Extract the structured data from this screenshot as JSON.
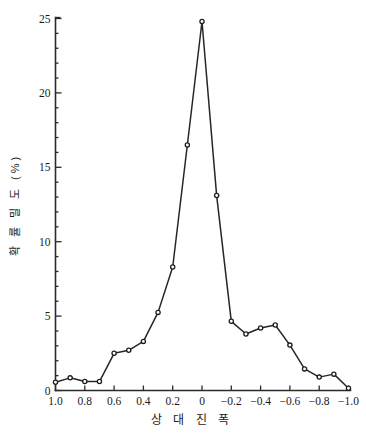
{
  "chart_data": {
    "type": "line",
    "title": "",
    "xlabel": "상 대 진 폭",
    "ylabel": "확 률 밀 도 (%)",
    "x": [
      1.0,
      0.9,
      0.8,
      0.7,
      0.6,
      0.5,
      0.4,
      0.3,
      0.2,
      0.1,
      0.0,
      -0.1,
      -0.2,
      -0.3,
      -0.4,
      -0.5,
      -0.6,
      -0.7,
      -0.8,
      -0.9,
      -1.0
    ],
    "values": [
      0.55,
      0.85,
      0.6,
      0.6,
      2.5,
      2.7,
      3.3,
      5.25,
      8.3,
      16.5,
      24.8,
      13.1,
      4.65,
      3.8,
      4.2,
      4.4,
      3.05,
      1.45,
      0.9,
      1.1,
      0.15
    ],
    "xlim": [
      1.0,
      -1.0
    ],
    "ylim": [
      0,
      25
    ],
    "xticks": [
      1.0,
      0.8,
      0.6,
      0.4,
      0.2,
      0.0,
      -0.2,
      -0.4,
      -0.6,
      -0.8,
      -1.0
    ],
    "xtick_labels": [
      "1.0",
      "0.8",
      "0.6",
      "0.4",
      "0.2",
      "0",
      "−0.2",
      "−0.4",
      "−0.6",
      "−0.8",
      "−1.0"
    ],
    "yticks": [
      0,
      5,
      10,
      15,
      20,
      25
    ],
    "ytick_labels": [
      "0",
      "5",
      "10",
      "15",
      "20",
      "25"
    ],
    "x_axis_reversed": true,
    "grid": false,
    "legend": false,
    "marker": "open-circle",
    "line_color": "#262626",
    "marker_fill": "#ffffff",
    "background": "#ffffff"
  },
  "figure": {
    "axis_color": "#2b2b2b",
    "text_color": "#1a1a1a"
  }
}
